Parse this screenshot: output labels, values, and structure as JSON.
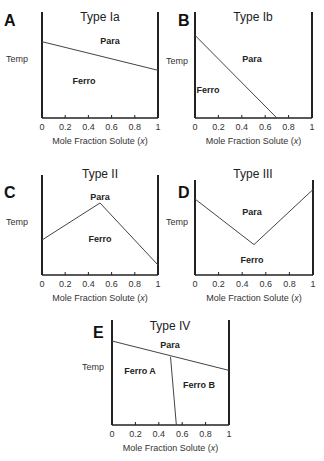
{
  "chart_data": [
    {
      "type": "line",
      "panel": "A",
      "title": "Type Ia",
      "xlabel": "Mole Fraction Solute (x)",
      "ylabel": "Temp",
      "xticks": [
        "0",
        "0.2",
        "0.4",
        "0.6",
        "0.8",
        "1"
      ],
      "xlim": [
        0,
        1
      ],
      "regions": [
        "Para",
        "Ferro"
      ],
      "boundary": [
        [
          0,
          0.72
        ],
        [
          1,
          0.45
        ]
      ]
    },
    {
      "type": "line",
      "panel": "B",
      "title": "Type Ib",
      "xlabel": "Mole Fraction Solute (x)",
      "ylabel": "Temp",
      "xticks": [
        "0",
        "0.2",
        "0.4",
        "0.6",
        "0.8",
        "1"
      ],
      "xlim": [
        0,
        1
      ],
      "regions": [
        "Para",
        "Ferro"
      ],
      "boundary": [
        [
          0,
          0.78
        ],
        [
          0.7,
          0
        ]
      ]
    },
    {
      "type": "line",
      "panel": "C",
      "title": "Type II",
      "xlabel": "Mole Fraction Solute (x)",
      "ylabel": "Temp",
      "xticks": [
        "0",
        "0.2",
        "0.4",
        "0.6",
        "0.8",
        "1"
      ],
      "xlim": [
        0,
        1
      ],
      "regions": [
        "Para",
        "Ferro"
      ],
      "boundary": [
        [
          0,
          0.35
        ],
        [
          0.5,
          0.72
        ],
        [
          1,
          0.1
        ]
      ]
    },
    {
      "type": "line",
      "panel": "D",
      "title": "Type III",
      "xlabel": "Mole Fraction Solute (x)",
      "ylabel": "Temp",
      "xticks": [
        "0",
        "0.2",
        "0.4",
        "0.6",
        "0.8",
        "1"
      ],
      "xlim": [
        0,
        1
      ],
      "regions": [
        "Para",
        "Ferro"
      ],
      "boundary": [
        [
          0,
          0.8
        ],
        [
          0.5,
          0.32
        ],
        [
          1,
          0.9
        ]
      ]
    },
    {
      "type": "line",
      "panel": "E",
      "title": "Type IV",
      "xlabel": "Mole Fraction Solute (x)",
      "ylabel": "Temp",
      "xticks": [
        "0",
        "0.2",
        "0.4",
        "0.6",
        "0.8",
        "1"
      ],
      "xlim": [
        0,
        1
      ],
      "regions": [
        "Para",
        "Ferro A",
        "Ferro B"
      ],
      "boundary": [
        [
          0,
          0.8
        ],
        [
          1,
          0.52
        ]
      ],
      "boundary2": [
        [
          0.5,
          0.65
        ],
        [
          0.55,
          0
        ]
      ]
    }
  ],
  "panels": {
    "A": {
      "letter": "A",
      "title": "Type Ia",
      "ylabel": "Temp",
      "xlabel": "Mole Fraction Solute (x)",
      "regions": [
        "Para",
        "Ferro"
      ]
    },
    "B": {
      "letter": "B",
      "title": "Type Ib",
      "ylabel": "Temp",
      "xlabel": "Mole Fraction Solute (x)",
      "regions": [
        "Para",
        "Ferro"
      ]
    },
    "C": {
      "letter": "C",
      "title": "Type II",
      "ylabel": "Temp",
      "xlabel": "Mole Fraction Solute (x)",
      "regions": [
        "Para",
        "Ferro"
      ]
    },
    "D": {
      "letter": "D",
      "title": "Type III",
      "ylabel": "Temp",
      "xlabel": "Mole Fraction Solute (x)",
      "regions": [
        "Para",
        "Ferro"
      ]
    },
    "E": {
      "letter": "E",
      "title": "Type IV",
      "ylabel": "Temp",
      "xlabel": "Mole Fraction Solute (x)",
      "regions": [
        "Para",
        "Ferro A",
        "Ferro B"
      ]
    }
  },
  "ticks": [
    "0",
    "0.2",
    "0.4",
    "0.6",
    "0.8",
    "1"
  ],
  "xlabel_prefix": "Mole Fraction Solute (",
  "xlabel_var": "x",
  "xlabel_suffix": ")"
}
